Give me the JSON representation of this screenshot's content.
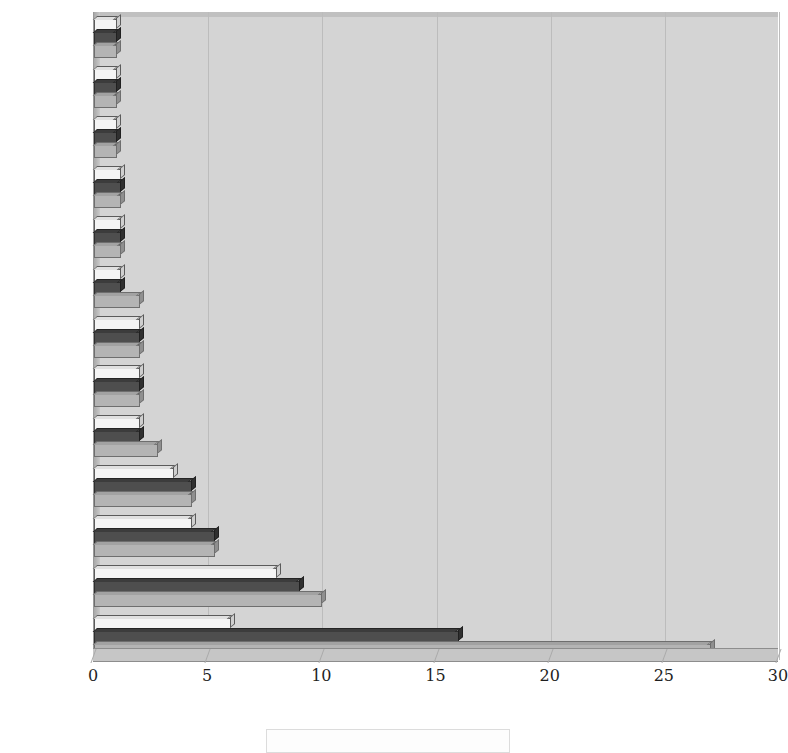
{
  "chart_data": {
    "type": "bar",
    "orientation": "horizontal",
    "title": "",
    "subtitle": "",
    "xlabel": "",
    "ylabel": "",
    "xlim": [
      0,
      30
    ],
    "xticks": [
      0,
      5,
      10,
      15,
      20,
      25,
      30
    ],
    "xtick_labels": [
      "0",
      "5",
      "10",
      "15",
      "20",
      "25",
      "30"
    ],
    "grid": true,
    "grid_axis": "x",
    "legend_position": "bottom",
    "legend_entries": [],
    "categories": [
      "大雞籠",
      "牛罵",
      "半線",
      "麻里麻崙",
      "大目降",
      "麻豆",
      "打猫",
      "大武壠",
      "大武郡",
      "蕭壠",
      "塔樓",
      "新港",
      "小琉球"
    ],
    "series": [
      {
        "name": "series-1",
        "color": "#f4f4f4",
        "values": [
          1.0,
          1.0,
          1.0,
          1.2,
          1.2,
          1.2,
          2.0,
          2.0,
          2.0,
          3.5,
          4.3,
          8.0,
          6.0
        ]
      },
      {
        "name": "series-2",
        "color": "#4e4e4e",
        "values": [
          1.0,
          1.0,
          1.0,
          1.2,
          1.2,
          1.2,
          2.0,
          2.0,
          2.0,
          4.3,
          5.3,
          9.0,
          16.0
        ]
      },
      {
        "name": "series-3",
        "color": "#b4b4b4",
        "values": [
          1.0,
          1.0,
          1.0,
          1.2,
          1.2,
          2.0,
          2.0,
          2.0,
          2.8,
          4.3,
          5.3,
          10.0,
          27.0
        ]
      }
    ]
  },
  "plot": {
    "background_color": "#d4d4d4",
    "gridline_color": "#bcbcbc",
    "axis_color": "#8d8d8d"
  }
}
